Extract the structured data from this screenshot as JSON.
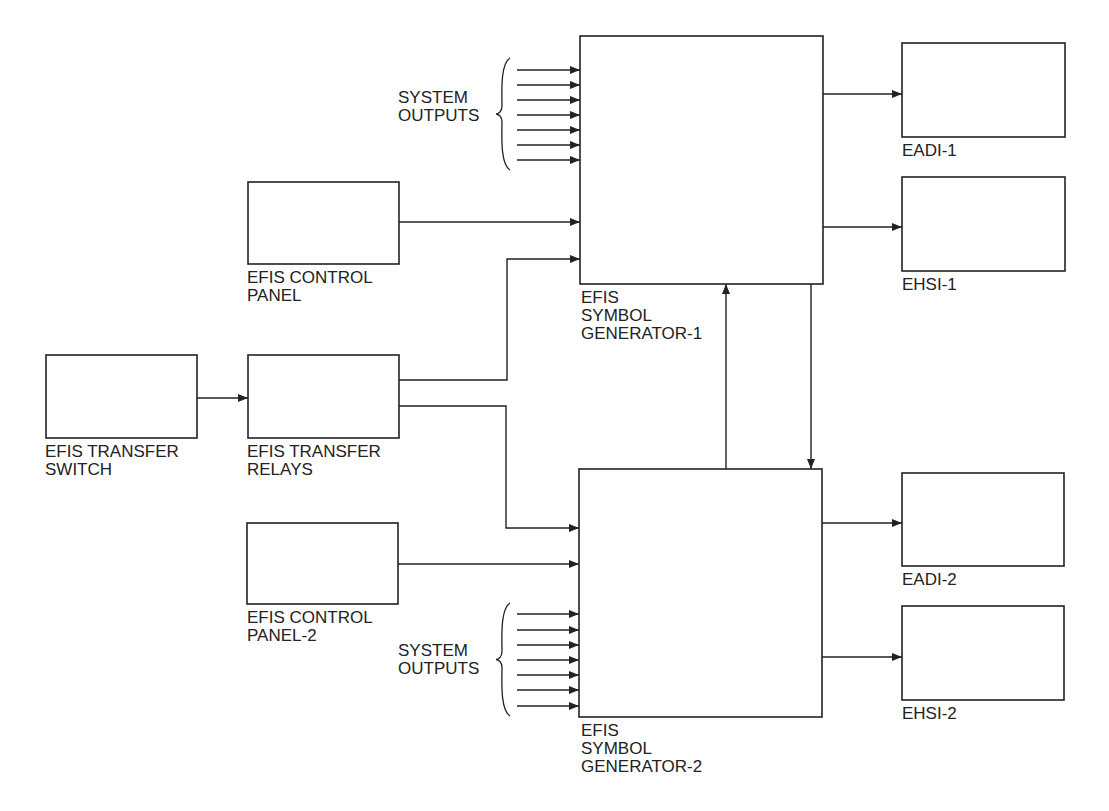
{
  "colors": {
    "line": "#222222",
    "background": "#ffffff"
  },
  "blocks": [
    {
      "id": "sg1",
      "name": "efis-symbol-generator-1",
      "x": 580,
      "y": 36,
      "w": 243,
      "h": 248,
      "label": [
        "EFIS",
        "SYMBOL",
        "GENERATOR-1"
      ],
      "label_x": 581,
      "label_y": 303
    },
    {
      "id": "sg2",
      "name": "efis-symbol-generator-2",
      "x": 579,
      "y": 469,
      "w": 243,
      "h": 248,
      "label": [
        "EFIS",
        "SYMBOL",
        "GENERATOR-2"
      ],
      "label_x": 581,
      "label_y": 736
    },
    {
      "id": "eadi1",
      "name": "eadi-1",
      "x": 902,
      "y": 43,
      "w": 163,
      "h": 94,
      "label": [
        "EADI-1"
      ],
      "label_x": 902,
      "label_y": 156
    },
    {
      "id": "ehsi1",
      "name": "ehsi-1",
      "x": 902,
      "y": 177,
      "w": 163,
      "h": 94,
      "label": [
        "EHSI-1"
      ],
      "label_x": 902,
      "label_y": 290
    },
    {
      "id": "eadi2",
      "name": "eadi-2",
      "x": 902,
      "y": 473,
      "w": 162,
      "h": 93,
      "label": [
        "EADI-2"
      ],
      "label_x": 902,
      "label_y": 585
    },
    {
      "id": "ehsi2",
      "name": "ehsi-2",
      "x": 902,
      "y": 606,
      "w": 162,
      "h": 94,
      "label": [
        "EHSI-2"
      ],
      "label_x": 902,
      "label_y": 719
    },
    {
      "id": "cp1",
      "name": "efis-control-panel-1",
      "x": 248,
      "y": 182,
      "w": 151,
      "h": 82,
      "label": [
        "EFIS CONTROL",
        "PANEL"
      ],
      "label_x": 247,
      "label_y": 283
    },
    {
      "id": "cp2",
      "name": "efis-control-panel-2",
      "x": 247,
      "y": 523,
      "w": 151,
      "h": 81,
      "label": [
        "EFIS CONTROL",
        "PANEL-2"
      ],
      "label_x": 247,
      "label_y": 623
    },
    {
      "id": "tsw",
      "name": "efis-transfer-switch",
      "x": 46,
      "y": 355,
      "w": 151,
      "h": 83,
      "label": [
        "EFIS TRANSFER",
        "SWITCH"
      ],
      "label_x": 45,
      "label_y": 457
    },
    {
      "id": "trl",
      "name": "efis-transfer-relays",
      "x": 248,
      "y": 355,
      "w": 151,
      "h": 83,
      "label": [
        "EFIS TRANSFER",
        "RELAYS"
      ],
      "label_x": 247,
      "label_y": 457
    }
  ],
  "system_outputs": [
    {
      "name": "system-outputs-1",
      "label": [
        "SYSTEM",
        "OUTPUTS"
      ],
      "label_x": 398,
      "label_y": 103,
      "brace_x": 506,
      "top": 58,
      "bottom": 170,
      "arrow_x1": 517,
      "arrow_x2": 580,
      "ys": [
        70,
        85,
        100,
        115,
        130,
        145,
        160
      ]
    },
    {
      "name": "system-outputs-2",
      "label": [
        "SYSTEM",
        "OUTPUTS"
      ],
      "label_x": 398,
      "label_y": 656,
      "brace_x": 506,
      "top": 603,
      "bottom": 716,
      "arrow_x1": 517,
      "arrow_x2": 579,
      "ys": [
        614,
        630,
        645,
        660,
        675,
        690,
        706
      ]
    }
  ],
  "connections": [
    {
      "name": "sg1-to-eadi1",
      "points": [
        [
          823,
          94
        ],
        [
          902,
          94
        ]
      ]
    },
    {
      "name": "sg1-to-ehsi1",
      "points": [
        [
          823,
          227
        ],
        [
          902,
          227
        ]
      ]
    },
    {
      "name": "sg2-to-eadi2",
      "points": [
        [
          822,
          523
        ],
        [
          902,
          523
        ]
      ]
    },
    {
      "name": "sg2-to-ehsi2",
      "points": [
        [
          822,
          657
        ],
        [
          902,
          657
        ]
      ]
    },
    {
      "name": "cp1-to-sg1",
      "points": [
        [
          399,
          222
        ],
        [
          580,
          222
        ]
      ]
    },
    {
      "name": "cp2-to-sg2",
      "points": [
        [
          398,
          564
        ],
        [
          579,
          564
        ]
      ]
    },
    {
      "name": "switch-to-relays",
      "points": [
        [
          197,
          398
        ],
        [
          248,
          398
        ]
      ]
    },
    {
      "name": "relays-to-sg1",
      "points": [
        [
          399,
          380
        ],
        [
          507,
          380
        ],
        [
          507,
          259
        ],
        [
          580,
          259
        ]
      ]
    },
    {
      "name": "relays-to-sg2",
      "points": [
        [
          399,
          406
        ],
        [
          506,
          406
        ],
        [
          506,
          528
        ],
        [
          579,
          528
        ]
      ]
    },
    {
      "name": "sg2-to-sg1",
      "points": [
        [
          726,
          469
        ],
        [
          726,
          284
        ]
      ]
    },
    {
      "name": "sg1-to-sg2",
      "points": [
        [
          811,
          284
        ],
        [
          811,
          469
        ]
      ]
    }
  ]
}
